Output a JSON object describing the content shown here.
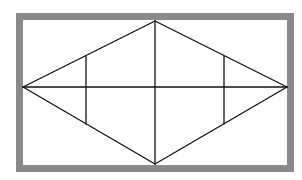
{
  "diagram": {
    "type": "geometric-figure",
    "frame": {
      "x": 16,
      "y": 13,
      "width": 278,
      "height": 159,
      "stroke": "#8a8a8a",
      "stroke_width": 7
    },
    "vertices": {
      "left": [
        23,
        87
      ],
      "top": [
        155,
        21
      ],
      "right": [
        287,
        87
      ],
      "bottom": [
        155,
        164
      ]
    },
    "segments": [
      {
        "name": "rhombus-edge-top-left",
        "from": [
          23,
          87
        ],
        "to": [
          155,
          21
        ]
      },
      {
        "name": "rhombus-edge-top-right",
        "from": [
          155,
          21
        ],
        "to": [
          287,
          87
        ]
      },
      {
        "name": "rhombus-edge-bottom-right",
        "from": [
          287,
          87
        ],
        "to": [
          155,
          164
        ]
      },
      {
        "name": "rhombus-edge-bottom-left",
        "from": [
          155,
          164
        ],
        "to": [
          23,
          87
        ]
      },
      {
        "name": "horizontal-diagonal",
        "from": [
          23,
          87
        ],
        "to": [
          287,
          87
        ]
      },
      {
        "name": "vertical-diagonal",
        "from": [
          155,
          21
        ],
        "to": [
          155,
          164
        ]
      },
      {
        "name": "left-vertical-segment",
        "from": [
          86,
          56
        ],
        "to": [
          86,
          124
        ]
      },
      {
        "name": "right-vertical-segment",
        "from": [
          224,
          56
        ],
        "to": [
          224,
          124
        ]
      }
    ],
    "line_color": "#111111",
    "line_width": 1.3
  }
}
